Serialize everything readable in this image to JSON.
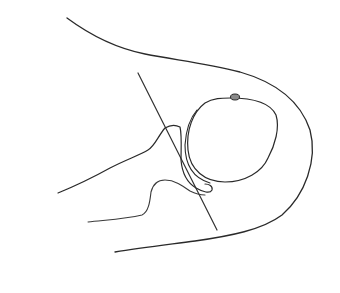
{
  "diagram": {
    "type": "line-drawing",
    "background": "#ffffff",
    "stroke_color": "#2a2a2a",
    "elements": [
      {
        "name": "outer-contour",
        "description": "outer soft-tissue outline"
      },
      {
        "name": "reference-line",
        "description": "straight oblique reference line"
      },
      {
        "name": "glenoid-upper-contour",
        "description": "upper scapular/glenoid outline"
      },
      {
        "name": "scapular-neck-contour",
        "description": "lower scapular neck outline"
      },
      {
        "name": "humeral-head",
        "description": "round humeral head outline"
      },
      {
        "name": "tuberosity-marker",
        "description": "small shaded oval on top of humeral head"
      }
    ]
  }
}
